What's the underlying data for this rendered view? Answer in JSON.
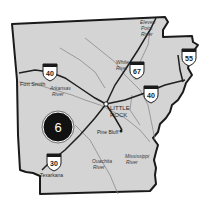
{
  "map": {
    "region": "Arkansas",
    "colors": {
      "land": "#d4d4d4",
      "border": "#1a1a1a",
      "river": "#8a8a8a",
      "highway": "#1f1f1f",
      "marker_fill": "#111111",
      "marker_text": "#ffffff",
      "background": "#ffffff"
    },
    "cities": [
      {
        "name": "Fort Smith"
      },
      {
        "name": "LITTLE",
        "name2": "ROCK"
      },
      {
        "name": "Pine Bluff"
      },
      {
        "name": "Texarkana"
      }
    ],
    "rivers": [
      {
        "line1": "Arkansas",
        "line2": "River"
      },
      {
        "line1": "White",
        "line2": "River"
      },
      {
        "line1": "Eleven",
        "line2": "Point",
        "line3": "River"
      },
      {
        "line1": "Ouachita",
        "line2": "River"
      },
      {
        "line1": "Mississippi",
        "line2": "River"
      }
    ],
    "interstates": [
      {
        "number": "40",
        "location": "west"
      },
      {
        "number": "67",
        "location": "north-central"
      },
      {
        "number": "55",
        "location": "northeast"
      },
      {
        "number": "40",
        "location": "east"
      },
      {
        "number": "30",
        "location": "southwest"
      }
    ],
    "marker": {
      "number": "6"
    }
  }
}
